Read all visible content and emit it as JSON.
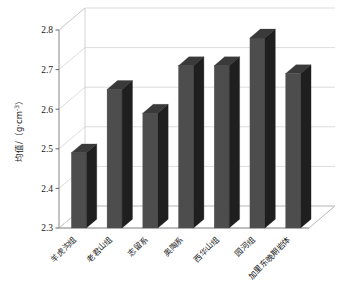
{
  "chart_data": {
    "type": "bar",
    "title": "",
    "subtitle": "",
    "xlabel": "",
    "ylabel": "均值/（g·cm⁻³）",
    "ylabel_parts": {
      "prefix": "均值/（g·cm",
      "exponent": "-3",
      "suffix": "）"
    },
    "categories": [
      "羊虎沟组",
      "老君山组",
      "志留系",
      "奥陶系",
      "西华山组",
      "园河组",
      "加里东晚期岩体"
    ],
    "values": [
      2.49,
      2.65,
      2.59,
      2.71,
      2.71,
      2.78,
      2.69
    ],
    "ylim": [
      2.3,
      2.8
    ],
    "ytick_labels": [
      "2.3",
      "2.4",
      "2.5",
      "2.6",
      "2.7",
      "2.8"
    ],
    "ytick_values": [
      2.3,
      2.4,
      2.5,
      2.6,
      2.7,
      2.8
    ],
    "grid": true,
    "legend": false,
    "legend_position": "none",
    "projection": "3d",
    "series": [
      {
        "name": "均值",
        "values": [
          2.49,
          2.65,
          2.59,
          2.71,
          2.71,
          2.78,
          2.69
        ]
      }
    ],
    "colors": {
      "bar_front": "#4d4d4d",
      "bar_top": "#3a3a3a",
      "bar_side": "#1f1f1f",
      "gridline": "#d9d9d9",
      "axis": "#808080",
      "floor": "#ffffff",
      "wall": "#ffffff",
      "text": "#1a1a1a"
    }
  }
}
